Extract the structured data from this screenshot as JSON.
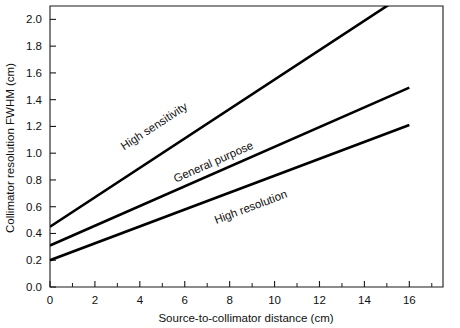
{
  "chart_data": {
    "type": "line",
    "title": "",
    "xlabel": "Source-to-collimator distance (cm)",
    "ylabel": "Collimator resolution FWHM (cm)",
    "xlim": [
      0,
      17.5
    ],
    "ylim": [
      0.0,
      2.1
    ],
    "grid": false,
    "legend_position": "inline-labels",
    "x_ticks_major": [
      0,
      2,
      4,
      6,
      8,
      10,
      12,
      14,
      16
    ],
    "x_ticks_major_labels": [
      "0",
      "2",
      "4",
      "6",
      "8",
      "10",
      "12",
      "14",
      "16"
    ],
    "x_ticks_minor": [
      1,
      3,
      5,
      7,
      9,
      11,
      13,
      15,
      17
    ],
    "y_ticks_major": [
      0.0,
      0.2,
      0.4,
      0.6,
      0.8,
      1.0,
      1.2,
      1.4,
      1.6,
      1.8,
      2.0
    ],
    "y_ticks_major_labels": [
      "0.0",
      "0.2",
      "0.4",
      "0.6",
      "0.8",
      "1.0",
      "1.2",
      "1.4",
      "1.6",
      "1.8",
      "2.0"
    ],
    "series": [
      {
        "name": "High sensitivity",
        "label": "High sensitivity",
        "color": "#000000",
        "x": [
          0,
          16
        ],
        "values": [
          0.45,
          2.21
        ],
        "x_clip_max": 15.25,
        "label_x": 3.3,
        "label_y": 1.02
      },
      {
        "name": "General purpose",
        "label": "General purpose",
        "color": "#000000",
        "x": [
          0,
          16
        ],
        "values": [
          0.31,
          1.49
        ],
        "x_clip_max": 16,
        "label_x": 5.6,
        "label_y": 0.78
      },
      {
        "name": "High resolution",
        "label": "High resolution",
        "color": "#000000",
        "x": [
          0,
          16
        ],
        "values": [
          0.2,
          1.21
        ],
        "x_clip_max": 16,
        "label_x": 7.4,
        "label_y": 0.47
      }
    ]
  }
}
